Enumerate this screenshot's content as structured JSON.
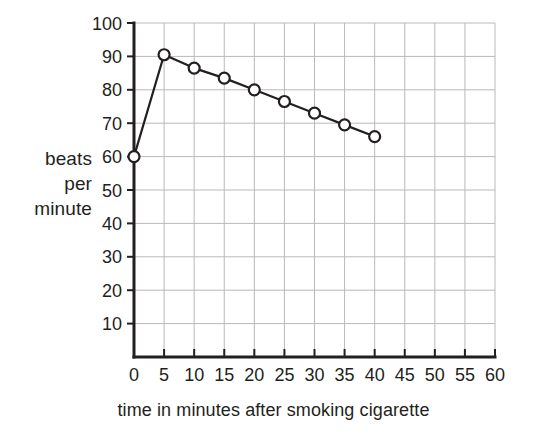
{
  "chart_data": {
    "type": "line",
    "title": "",
    "xlabel": "time in minutes after smoking cigarette",
    "ylabel": "beats per minute",
    "ylabel_lines": [
      "beats",
      "per",
      "minute"
    ],
    "x": [
      0,
      5,
      10,
      15,
      20,
      25,
      30,
      35,
      40
    ],
    "values": [
      60,
      90.5,
      86.5,
      83.5,
      80,
      76.5,
      73,
      69.5,
      66
    ],
    "series": [
      {
        "name": "heart rate",
        "values": [
          60,
          90.5,
          86.5,
          83.5,
          80,
          76.5,
          73,
          69.5,
          66
        ]
      }
    ],
    "xlim": [
      0,
      60
    ],
    "ylim": [
      0,
      100
    ],
    "xticks": [
      0,
      5,
      10,
      15,
      20,
      25,
      30,
      35,
      40,
      45,
      50,
      55,
      60
    ],
    "yticks": [
      10,
      20,
      30,
      40,
      50,
      60,
      70,
      80,
      90,
      100
    ],
    "xtick_labels": [
      "0",
      "5",
      "10",
      "15",
      "20",
      "25",
      "30",
      "35",
      "40",
      "45",
      "50",
      "55",
      "60"
    ],
    "ytick_labels": [
      "10",
      "20",
      "30",
      "40",
      "50",
      "60",
      "70",
      "80",
      "90",
      "100"
    ],
    "grid": true,
    "legend": false,
    "marker": "open-circle",
    "line_color": "#231f20",
    "grid_color": "#b9b9bb",
    "marker_fill": "#ffffff",
    "background": "#ffffff"
  }
}
